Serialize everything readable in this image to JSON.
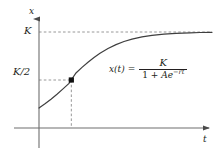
{
  "figure": {
    "axes": {
      "x_axis_label": "t",
      "y_axis_label": "x"
    },
    "tick_labels": {
      "carrying_capacity": "K",
      "half_capacity": "K/2"
    },
    "equation": {
      "lhs": "x(t)",
      "equals": "=",
      "numerator": "K",
      "denominator_prefix": "1 + ",
      "denominator_coefficient": "A",
      "denominator_base": "e",
      "denominator_exponent": "−rt",
      "plain_text": "x(t) = K / (1 + Ae^(-rt))"
    },
    "colors": {
      "curve": "#3f3f3f",
      "axis": "#6e6e6e",
      "dashed": "#8c8c8c",
      "text": "#231f20",
      "background": "#ffffff",
      "point": "#000000"
    }
  },
  "chart_data": {
    "type": "line",
    "xlabel": "t",
    "ylabel": "x",
    "grid": false,
    "legend": null,
    "xlim": [
      0,
      1
    ],
    "ylim": [
      0,
      1.12
    ],
    "annotations": [
      {
        "name": "carrying-capacity-line",
        "kind": "horizontal-dashed-asymptote",
        "label": "K",
        "y": 1.0
      },
      {
        "name": "half-capacity-line",
        "kind": "horizontal-dashed-segment",
        "label": "K/2",
        "y": 0.5
      },
      {
        "name": "inflection-drop-line",
        "kind": "vertical-dashed-segment",
        "x": 0.1869
      },
      {
        "name": "inflection-point",
        "kind": "point",
        "x": 0.1869,
        "y": 0.5
      },
      {
        "name": "equation-annotation",
        "kind": "text",
        "label": "x(t) = K / (1 + Ae^(-rt))",
        "x": 0.45,
        "y": 0.52
      }
    ],
    "series": [
      {
        "name": "x(t)",
        "comment": "Logistic curve in pixel space; x0=39 (t=0) to x=212, y=128 (x=0) to y=32 (x=K)",
        "points_px": [
          [
            39,
            108
          ],
          [
            45,
            103.8
          ],
          [
            51,
            99.2
          ],
          [
            57,
            94.2
          ],
          [
            63,
            88.9
          ],
          [
            69,
            83.4
          ],
          [
            76,
            73.0
          ],
          [
            82,
            67.4
          ],
          [
            88,
            62.2
          ],
          [
            94,
            57.5
          ],
          [
            100,
            53.3
          ],
          [
            108,
            48.5
          ],
          [
            116,
            44.6
          ],
          [
            124,
            41.5
          ],
          [
            132,
            39.1
          ],
          [
            142,
            36.9
          ],
          [
            152,
            35.3
          ],
          [
            164,
            34.1
          ],
          [
            176,
            33.4
          ],
          [
            190,
            32.8
          ],
          [
            200,
            32.5
          ],
          [
            212,
            32.3
          ]
        ]
      }
    ]
  }
}
